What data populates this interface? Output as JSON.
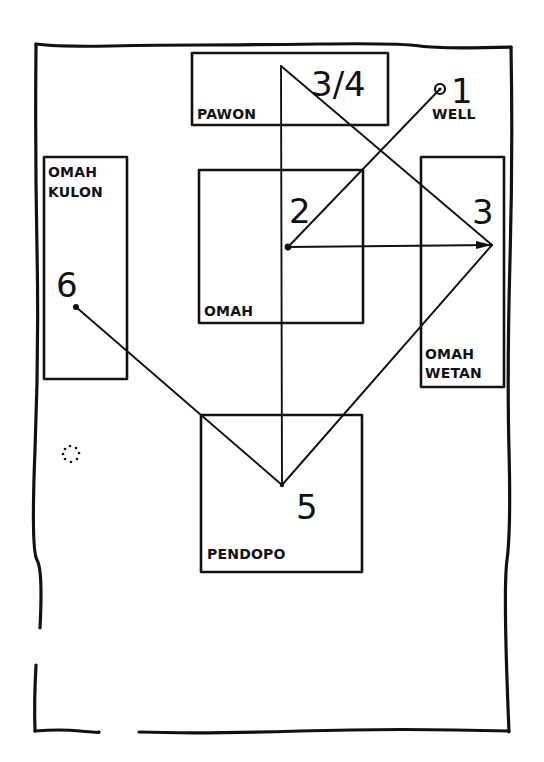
{
  "diagram": {
    "type": "house-compound-circulation-plan",
    "rooms": [
      {
        "id": "pawon",
        "label": "PAWON"
      },
      {
        "id": "omah",
        "label": "OMAH"
      },
      {
        "id": "omah-kulon",
        "label_line1": "OMAH",
        "label_line2": "KULON"
      },
      {
        "id": "omah-wetan",
        "label_line1": "OMAH",
        "label_line2": "WETAN"
      },
      {
        "id": "pendopo",
        "label": "PENDOPO"
      },
      {
        "id": "well",
        "label": "WELL"
      }
    ],
    "steps": [
      {
        "id": "step-1",
        "label": "1",
        "location": "well"
      },
      {
        "id": "step-2",
        "label": "2",
        "location": "omah"
      },
      {
        "id": "step-3",
        "label": "3",
        "location": "omah-wetan"
      },
      {
        "id": "step-3-4",
        "label": "3/4",
        "location": "pawon"
      },
      {
        "id": "step-5",
        "label": "5",
        "location": "pendopo"
      },
      {
        "id": "step-6",
        "label": "6",
        "location": "omah-kulon"
      }
    ],
    "paths": [
      {
        "from": "step-1",
        "to": "step-2"
      },
      {
        "from": "step-2",
        "to": "step-3",
        "arrow": true
      },
      {
        "from": "step-3-4",
        "to": "step-3"
      },
      {
        "from": "step-3-4",
        "to": "step-5"
      },
      {
        "from": "step-3",
        "to": "step-5"
      },
      {
        "from": "step-5",
        "to": "step-6"
      }
    ],
    "markers": [
      {
        "id": "dotted-circle",
        "description": "small dotted circle west of pendopo"
      }
    ],
    "colors": {
      "ink": "#111111",
      "paper": "#ffffff"
    }
  }
}
